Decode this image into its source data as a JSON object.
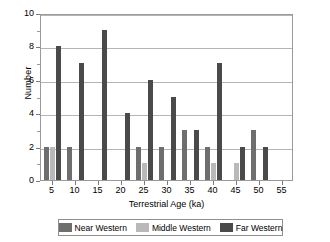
{
  "chart_data": {
    "type": "bar",
    "title": "",
    "xlabel": "Terrestrial Age (ka)",
    "ylabel": "Number",
    "categories": [
      5,
      10,
      15,
      20,
      25,
      30,
      35,
      40,
      45,
      50,
      55
    ],
    "xtick_labels": [
      "5",
      "10",
      "15",
      "20",
      "25",
      "30",
      "35",
      "40",
      "45",
      "50",
      "55"
    ],
    "ytick_labels": [
      "0",
      "2",
      "4",
      "6",
      "8",
      "10"
    ],
    "ylim": [
      0,
      10
    ],
    "ytick_step": 2,
    "xlim": [
      2.5,
      57.5
    ],
    "grid": "horizontal",
    "legend_position": "bottom",
    "series": [
      {
        "name": "Near Western",
        "color": "#6e6e6e",
        "values": [
          2,
          2,
          0,
          0,
          2,
          2,
          3,
          2,
          0,
          3,
          0
        ]
      },
      {
        "name": "Middle Western",
        "color": "#b9b9b9",
        "values": [
          2,
          0,
          0,
          0,
          1,
          0,
          0,
          1,
          1,
          0,
          0
        ]
      },
      {
        "name": "Far Western",
        "color": "#4a4a4a",
        "values": [
          8,
          7,
          9,
          4,
          6,
          5,
          3,
          7,
          2,
          2,
          0
        ]
      }
    ]
  }
}
